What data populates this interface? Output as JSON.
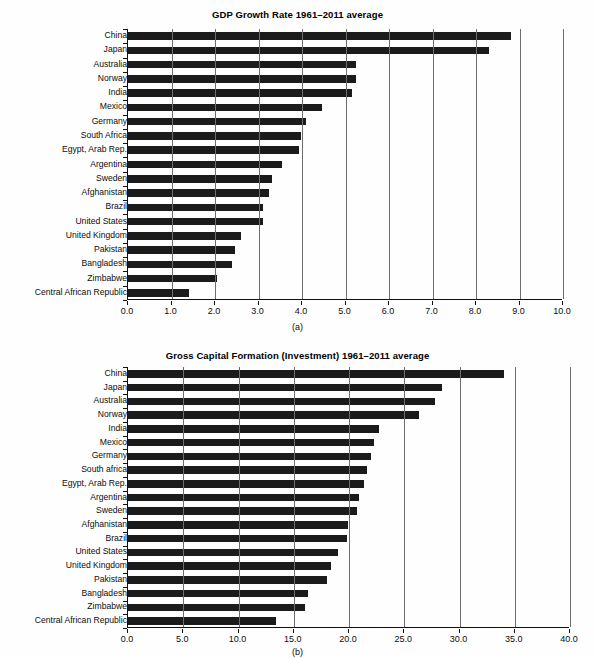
{
  "figure": {
    "categories": [
      "China",
      "Japan",
      "Australia",
      "Norway",
      "India",
      "Mexico",
      "Germany",
      "South Africa",
      "Egypt, Arab Rep.",
      "Argentina",
      "Sweden",
      "Afghanistan",
      "Brazil",
      "United States",
      "United Kingdom",
      "Pakistan",
      "Bangladesh",
      "Zimbabwe",
      "Central African Republic"
    ]
  },
  "chart_data": [
    {
      "type": "bar",
      "orientation": "horizontal",
      "panel": "a",
      "caption": "(a)",
      "title": "GDP Growth Rate 1961–2011 average",
      "xlabel": "",
      "ylabel": "",
      "xlim": [
        0,
        10
      ],
      "xticks": [
        0,
        1,
        2,
        3,
        4,
        5,
        6,
        7,
        8,
        9,
        10
      ],
      "xticklabels": [
        "0.0",
        "1.0",
        "2.0",
        "3.0",
        "4.0",
        "5.0",
        "6.0",
        "7.0",
        "8.0",
        "9.0",
        "10.0"
      ],
      "grid": "vertical",
      "legend": "none",
      "bar_color": "#1b1b1b",
      "categories": [
        "China",
        "Japan",
        "Australia",
        "Norway",
        "India",
        "Mexico",
        "Germany",
        "South Africa",
        "Egypt, Arab Rep.",
        "Argentina",
        "Sweden",
        "Afghanistan",
        "Brazil",
        "United States",
        "United Kingdom",
        "Pakistan",
        "Bangladesh",
        "Zimbabwe",
        "Central African Republic"
      ],
      "values": [
        8.8,
        8.3,
        5.25,
        5.25,
        5.15,
        4.45,
        4.1,
        3.97,
        3.92,
        3.55,
        3.3,
        3.25,
        3.1,
        3.1,
        2.6,
        2.45,
        2.4,
        2.05,
        1.4
      ]
    },
    {
      "type": "bar",
      "orientation": "horizontal",
      "panel": "b",
      "caption": "(b)",
      "title": "Gross Capital Formation (Investment) 1961–2011 average",
      "xlabel": "",
      "ylabel": "",
      "xlim": [
        0,
        40
      ],
      "xticks": [
        0,
        5,
        10,
        15,
        20,
        25,
        30,
        35,
        40
      ],
      "xticklabels": [
        "0.0",
        "5.0",
        "10.0",
        "15.0",
        "20.0",
        "25.0",
        "30.0",
        "35.0",
        "40.0"
      ],
      "grid": "vertical",
      "legend": "none",
      "bar_color": "#1b1b1b",
      "categories": [
        "China",
        "Japan",
        "Australia",
        "Norway",
        "India",
        "Mexico",
        "Germany",
        "South africa",
        "Egypt, Arab Rep.",
        "Argentina",
        "Sweden",
        "Afghanistan",
        "Brazil",
        "United States",
        "United Kingdom",
        "Pakistan",
        "Bangladesh",
        "Zimbabwe",
        "Central African Republic"
      ],
      "values": [
        34.0,
        28.4,
        27.8,
        26.3,
        22.7,
        22.3,
        22.0,
        21.6,
        21.4,
        20.9,
        20.7,
        19.9,
        19.8,
        19.0,
        18.4,
        18.0,
        16.3,
        16.0,
        13.4
      ]
    }
  ]
}
